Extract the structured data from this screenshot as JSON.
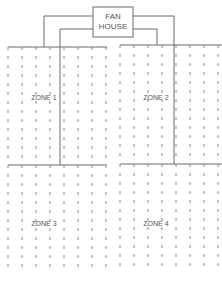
{
  "diagram": {
    "fan_house": {
      "line1": "FAN",
      "line2": "HOUSE"
    },
    "zones": [
      {
        "label": "ZONE 1"
      },
      {
        "label": "ZONE 2"
      },
      {
        "label": "ZONE 3"
      },
      {
        "label": "ZONE 4"
      }
    ],
    "colors": {
      "line": "#6b6b6b",
      "dash": "#8a8a8a",
      "background": "#ffffff"
    }
  }
}
